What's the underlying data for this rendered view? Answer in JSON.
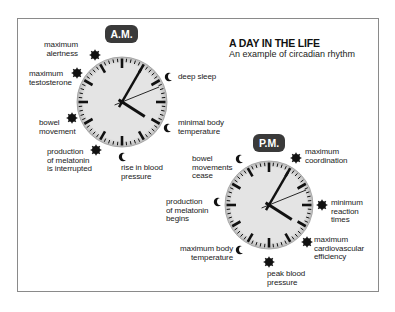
{
  "header": {
    "title": "A DAY IN THE LIFE",
    "subtitle": "An example of circadian rhythm"
  },
  "colors": {
    "pill_bg": "#3a3a3a",
    "clock_face": "#e2e2e2",
    "ink": "#111111",
    "frame": "#8a8a8a"
  },
  "am_clock": {
    "badge": "A.M.",
    "time_shown": "4:05",
    "events": [
      {
        "label_lines": [
          "maximum",
          "alertness"
        ],
        "marker": "sun"
      },
      {
        "label_lines": [
          "maximum",
          "testosterone"
        ],
        "marker": "sun"
      },
      {
        "label_lines": [
          "bowel",
          "movement"
        ],
        "marker": "sun"
      },
      {
        "label_lines": [
          "production",
          "of melatonin",
          "is interrupted"
        ],
        "marker": "sun"
      },
      {
        "label_lines": [
          "rise in blood",
          "pressure"
        ],
        "marker": "moon"
      },
      {
        "label_lines": [
          "minimal body",
          "temperature"
        ],
        "marker": "moon"
      },
      {
        "label_lines": [
          "deep sleep"
        ],
        "marker": "moon"
      }
    ]
  },
  "pm_clock": {
    "badge": "P.M.",
    "time_shown": "4:05",
    "events": [
      {
        "label_lines": [
          "bowel",
          "movements",
          "cease"
        ],
        "marker": "moon"
      },
      {
        "label_lines": [
          "production",
          "of melatonin",
          "begins"
        ],
        "marker": "moon"
      },
      {
        "label_lines": [
          "maximum body",
          "temperature"
        ],
        "marker": "moon"
      },
      {
        "label_lines": [
          "peak blood",
          "pressure"
        ],
        "marker": "sun"
      },
      {
        "label_lines": [
          "maximum",
          "cardiovascular",
          "efficiency"
        ],
        "marker": "sun"
      },
      {
        "label_lines": [
          "minimum",
          "reaction",
          "times"
        ],
        "marker": "sun"
      },
      {
        "label_lines": [
          "maximum",
          "coordination"
        ],
        "marker": "sun"
      }
    ]
  }
}
